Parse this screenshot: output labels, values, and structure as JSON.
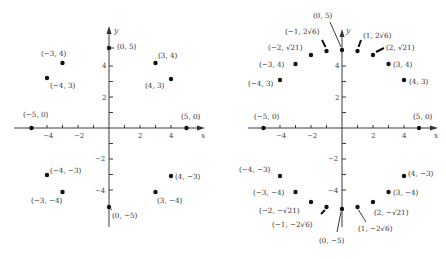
{
  "figure": {
    "left_plot": {
      "axis_labels": {
        "x": "x",
        "y": "y"
      },
      "x_ticks": [
        {
          "value": -4,
          "label": "−4"
        },
        {
          "value": -2,
          "label": "−2"
        },
        {
          "value": 2,
          "label": "2"
        },
        {
          "value": 4,
          "label": "4"
        }
      ],
      "y_ticks": [
        {
          "value": 4,
          "label": "4"
        },
        {
          "value": 2,
          "label": "2"
        },
        {
          "value": -2,
          "label": "−2"
        },
        {
          "value": -4,
          "label": "−4"
        }
      ],
      "points": [
        {
          "x": 0,
          "y": 5,
          "label": "(0, 5)"
        },
        {
          "x": 3,
          "y": 4,
          "label": "(3, 4)"
        },
        {
          "x": 4,
          "y": 3,
          "label": "(4, 3)"
        },
        {
          "x": 5,
          "y": 0,
          "label": "(5, 0)"
        },
        {
          "x": 4,
          "y": -3,
          "label": "(4, −3)"
        },
        {
          "x": 3,
          "y": -4,
          "label": "(3, −4)"
        },
        {
          "x": 0,
          "y": -5,
          "label": "(0, −5)"
        },
        {
          "x": -3,
          "y": -4,
          "label": "(−3, −4)"
        },
        {
          "x": -4,
          "y": -3,
          "label": "(−4, −3)"
        },
        {
          "x": -5,
          "y": 0,
          "label": "(−5, 0)"
        },
        {
          "x": -4,
          "y": 3,
          "label": "(−4, 3)"
        },
        {
          "x": -3,
          "y": 4,
          "label": "(−3, 4)"
        }
      ]
    },
    "right_plot": {
      "axis_labels": {
        "x": "x",
        "y": "y"
      },
      "x_ticks": [
        {
          "value": -4,
          "label": "−4"
        },
        {
          "value": -2,
          "label": "−2"
        },
        {
          "value": 2,
          "label": "2"
        },
        {
          "value": 4,
          "label": "4"
        }
      ],
      "y_ticks": [
        {
          "value": 4,
          "label": "4"
        },
        {
          "value": 2,
          "label": "2"
        },
        {
          "value": -2,
          "label": "−2"
        },
        {
          "value": -4,
          "label": "−4"
        }
      ],
      "points": [
        {
          "x": 0,
          "y": 5,
          "label": "(0, 5)"
        },
        {
          "x": 1,
          "y": 4.899,
          "label": "(1, 2√6)"
        },
        {
          "x": 2,
          "y": 4.583,
          "label": "(2, √21)"
        },
        {
          "x": 3,
          "y": 4,
          "label": "(3, 4)"
        },
        {
          "x": 4,
          "y": 3,
          "label": "(4, 3)"
        },
        {
          "x": 5,
          "y": 0,
          "label": "(5, 0)"
        },
        {
          "x": 4,
          "y": -3,
          "label": "(4, −3)"
        },
        {
          "x": 3,
          "y": -4,
          "label": "(3, −4)"
        },
        {
          "x": 2,
          "y": -4.583,
          "label": "(2, −√21)"
        },
        {
          "x": 1,
          "y": -4.899,
          "label": "(1, −2√6)"
        },
        {
          "x": 0,
          "y": -5,
          "label": "(0, −5)"
        },
        {
          "x": -1,
          "y": -4.899,
          "label": "(−1, −2√6)"
        },
        {
          "x": -2,
          "y": -4.583,
          "label": "(−2, −√21)"
        },
        {
          "x": -3,
          "y": -4,
          "label": "(−3, −4)"
        },
        {
          "x": -4,
          "y": -3,
          "label": "(−4, −3)"
        },
        {
          "x": -5,
          "y": 0,
          "label": "(−5, 0)"
        },
        {
          "x": -4,
          "y": 3,
          "label": "(−4, 3)"
        },
        {
          "x": -3,
          "y": 4,
          "label": "(−3, 4)"
        },
        {
          "x": -2,
          "y": 4.583,
          "label": "(−2, √21)"
        },
        {
          "x": -1,
          "y": 4.899,
          "label": "(−1, 2√6)"
        }
      ]
    }
  }
}
